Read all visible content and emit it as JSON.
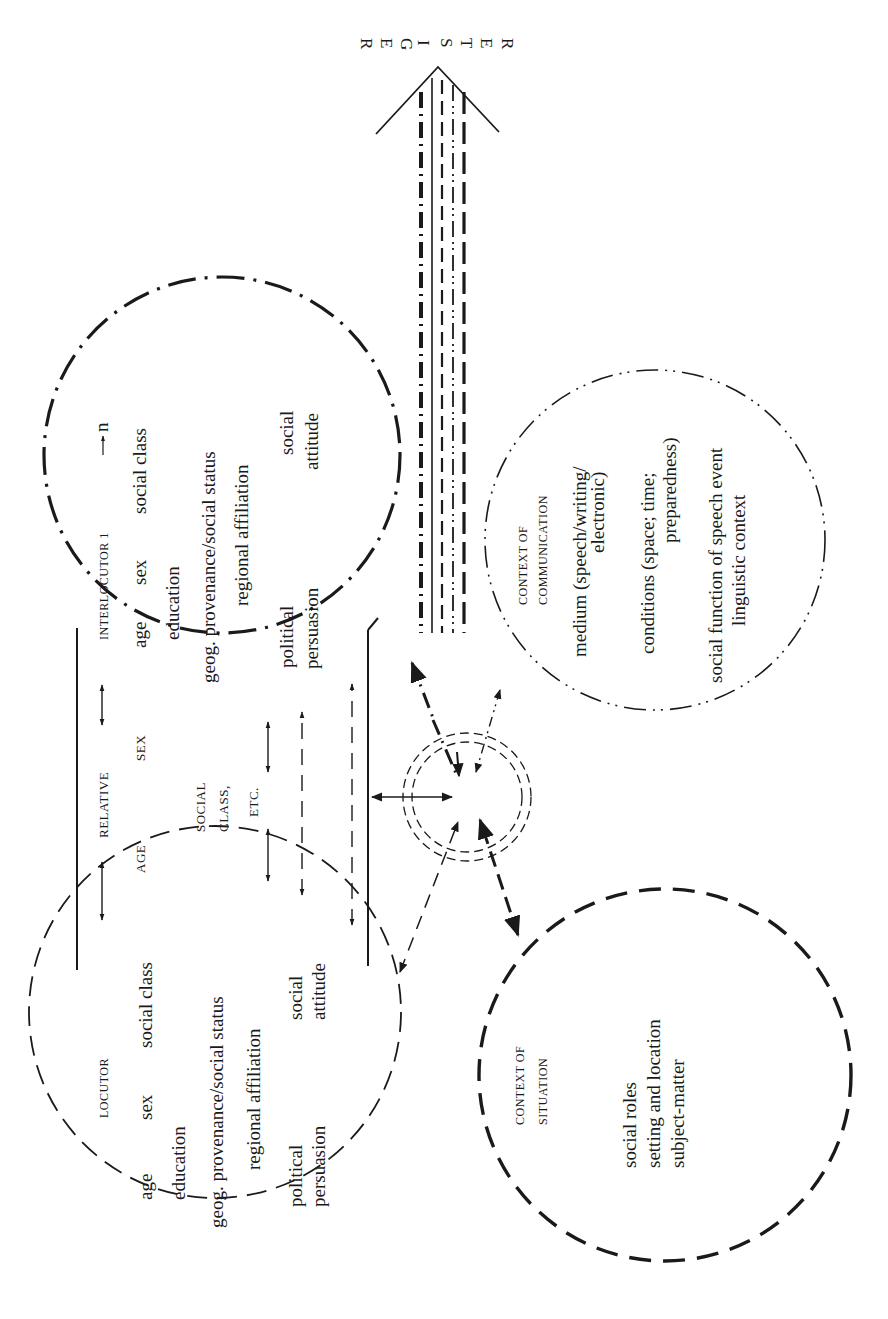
{
  "register": {
    "label": "REGISTER",
    "letters": [
      "R",
      "E",
      "G",
      "I",
      "S",
      "T",
      "E",
      "R"
    ]
  },
  "locutor": {
    "title": "LOCUTOR",
    "lines": [
      "age      sex      social class",
      "education",
      "geog. provenance/social status",
      "regional affiliation",
      "social",
      "attitude",
      "political",
      "persuasion"
    ],
    "row1": {
      "age": "age",
      "sex": "sex",
      "social_class": "social class"
    },
    "education": "education",
    "geog": "geog. provenance/social status",
    "regional": "regional affiliation",
    "social": "social",
    "attitude": "attitude",
    "political": "political",
    "persuasion": "persuasion"
  },
  "interlocutor": {
    "title": "INTERLOCUTOR 1",
    "title_suffix": "n",
    "row1": {
      "age": "age",
      "sex": "sex",
      "social_class": "social class"
    },
    "education": "education",
    "geog": "geog. provenance/social status",
    "regional": "regional affiliation",
    "social": "social",
    "attitude": "attitude",
    "political": "political",
    "persuasion": "persuasion"
  },
  "relative": {
    "title": "RELATIVE",
    "age": "AGE",
    "sex": "SEX",
    "social": "SOCIAL",
    "class": "CLASS,",
    "etc": "ETC."
  },
  "context_communication": {
    "title_1": "CONTEXT OF",
    "title_2": "COMMUNICATION",
    "medium_1": "medium (speech/writing/",
    "medium_2": "electronic)",
    "conditions_1": "conditions (space; time;",
    "conditions_2": "preparedness)",
    "social_function": "social function of speech event",
    "linguistic": "linguistic context"
  },
  "context_situation": {
    "title_1": "CONTEXT OF",
    "title_2": "SITUATION",
    "roles": "social roles",
    "setting": "setting and location",
    "subject": "subject-matter"
  },
  "colors": {
    "ink": "#1a1a1a",
    "background": "#ffffff"
  }
}
